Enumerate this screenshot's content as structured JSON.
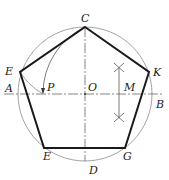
{
  "caption": "",
  "colors": {
    "pentagon": "#1a1a1a",
    "circle": "#888888",
    "centerline": "#555555",
    "construction": "#444444"
  },
  "labels": {
    "C": "C",
    "E_upper": "E",
    "K": "K",
    "A": "A",
    "P": "P",
    "O": "O",
    "M": "M",
    "B": "B",
    "E_lower": "E",
    "G": "G",
    "D": "D"
  },
  "diagram": {
    "type": "regular-pentagon-construction",
    "circle": {
      "cx": 85,
      "cy": 94,
      "r": 67
    },
    "pentagon_vertices": [
      {
        "name": "C",
        "x": 85,
        "y": 27
      },
      {
        "name": "K",
        "x": 149,
        "y": 72
      },
      {
        "name": "G",
        "x": 125,
        "y": 148
      },
      {
        "name": "E",
        "x": 44,
        "y": 148
      },
      {
        "name": "E",
        "x": 20,
        "y": 72
      }
    ],
    "points": {
      "O": {
        "x": 85,
        "y": 94
      },
      "A": {
        "x": 18,
        "y": 94
      },
      "B": {
        "x": 152,
        "y": 94
      },
      "D": {
        "x": 85,
        "y": 161
      },
      "M": {
        "x": 119,
        "y": 94
      },
      "P": {
        "x": 43,
        "y": 94
      }
    }
  }
}
